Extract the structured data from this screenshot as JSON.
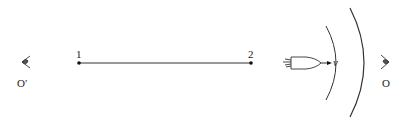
{
  "diagram": {
    "points": [
      {
        "label": "1"
      },
      {
        "label": "2"
      }
    ],
    "velocity_label": "v",
    "observers": [
      {
        "label": "O′",
        "side": "left"
      },
      {
        "label": "O",
        "side": "right"
      }
    ],
    "colors": {
      "stroke": "#222222",
      "background": "#ffffff"
    }
  }
}
